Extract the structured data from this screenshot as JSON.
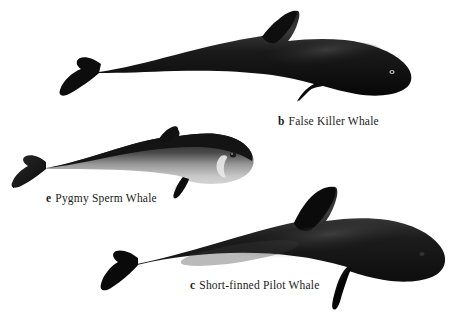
{
  "plate": {
    "background_color": "#ffffff",
    "width": 457,
    "height": 315,
    "type": "field-guide illustration plate",
    "subject": "Whales"
  },
  "figures": [
    {
      "key": "false_killer_whale",
      "letter": "b",
      "name": "False Killer Whale",
      "body_color": "#0d0d0d",
      "highlight_color": "#3c3c3c",
      "eye_color": "#d8d8d8",
      "caption_text": "False Killer Whale"
    },
    {
      "key": "pygmy_sperm_whale",
      "letter": "e",
      "name": "Pygmy Sperm Whale",
      "body_color": "#151515",
      "belly_color": "#cfcfcf",
      "highlight_color": "#8a8a8a",
      "eye_color": "#1a1a1a",
      "caption_text": "Pygmy Sperm Whale"
    },
    {
      "key": "short_finned_pilot_whale",
      "letter": "c",
      "name": "Short-finned Pilot Whale",
      "body_color": "#0b0b0b",
      "highlight_color": "#454545",
      "eye_color": "#2a2a2a",
      "caption_text": "Short-finned Pilot Whale"
    }
  ],
  "captions": {
    "b": {
      "letter": "b",
      "text": "False Killer Whale"
    },
    "e": {
      "letter": "e",
      "text": "Pygmy Sperm Whale"
    },
    "c": {
      "letter": "c",
      "text": "Short-finned Pilot Whale"
    }
  }
}
